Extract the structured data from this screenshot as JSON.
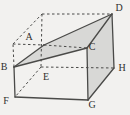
{
  "figure": {
    "name": "cuboid-cross-section-diagram",
    "canvas": {
      "width": 130,
      "height": 115
    },
    "colors": {
      "background": "#f2f1ef",
      "line": "#4a4a48",
      "shade": "#d8d8d6",
      "label": "#2f2f2d"
    },
    "style": {
      "solid_width": 1.3,
      "dashed_width": 1.0,
      "dash_pattern": "2.5,2.5",
      "label_font_size": 10
    },
    "vertices": {
      "A": [
        44,
        45
      ],
      "B": [
        14,
        67
      ],
      "C": [
        87,
        48
      ],
      "D": [
        112,
        14
      ],
      "E": [
        41,
        67
      ],
      "F": [
        15,
        97
      ],
      "G": [
        88,
        100
      ],
      "H": [
        114,
        68
      ],
      "T1": [
        13,
        44
      ],
      "T2": [
        42,
        14
      ]
    },
    "shaded_faces": [
      {
        "name": "cross-section-BADC",
        "points": [
          "B",
          "A",
          "D",
          "C"
        ]
      },
      {
        "name": "right-face-CDHG",
        "points": [
          "C",
          "D",
          "H",
          "G"
        ]
      }
    ],
    "solid_edges": [
      [
        "B",
        "F"
      ],
      [
        "F",
        "G"
      ],
      [
        "G",
        "C"
      ],
      [
        "G",
        "H"
      ],
      [
        "H",
        "D"
      ],
      [
        "C",
        "D"
      ],
      [
        "B",
        "C"
      ],
      [
        "B",
        "A"
      ],
      [
        "A",
        "D"
      ]
    ],
    "dashed_edges": [
      [
        "B",
        "T1"
      ],
      [
        "T1",
        "T2"
      ],
      [
        "T2",
        "D"
      ],
      [
        "T1",
        "A"
      ],
      [
        "A",
        "C"
      ],
      [
        "T2",
        "E"
      ],
      [
        "E",
        "H"
      ],
      [
        "E",
        "F"
      ]
    ],
    "labels": [
      {
        "text": "A",
        "x": 29,
        "y": 40
      },
      {
        "text": "B",
        "x": 4,
        "y": 70
      },
      {
        "text": "C",
        "x": 92,
        "y": 50
      },
      {
        "text": "D",
        "x": 119,
        "y": 11
      },
      {
        "text": "E",
        "x": 46,
        "y": 80
      },
      {
        "text": "F",
        "x": 6,
        "y": 104
      },
      {
        "text": "G",
        "x": 92,
        "y": 108
      },
      {
        "text": "H",
        "x": 122,
        "y": 71
      }
    ]
  }
}
